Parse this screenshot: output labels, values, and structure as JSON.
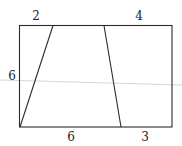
{
  "diagram": {
    "type": "geometry",
    "colors": {
      "stroke": "#2a2a2a",
      "guide_line": "#c8ccd0",
      "label": "#222222"
    },
    "labels": {
      "top_left": "2",
      "top_right": "4",
      "left_side": "6",
      "bottom_left": "6",
      "bottom_right": "3"
    },
    "shapes": [
      {
        "name": "left-triangle",
        "segments": [
          "top-left 2",
          "left side 6"
        ]
      },
      {
        "name": "middle-trapezoid",
        "segments": [
          "bottom 6"
        ]
      },
      {
        "name": "right-trapezoid",
        "segments": [
          "top 4",
          "bottom 3"
        ]
      }
    ]
  }
}
